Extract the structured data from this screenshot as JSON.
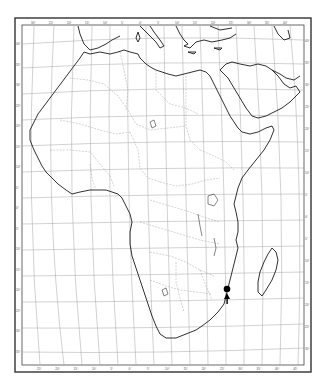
{
  "map": {
    "title_partial": "",
    "region": "Africa",
    "projection": "conic grid with curved parallels",
    "colors": {
      "coastline": "#1a1a1a",
      "borders": "#a8a8a8",
      "graticule": "#9a9a9a",
      "frame": "#333333",
      "markers": "#000000"
    },
    "top_ticks": [
      "30°",
      "25°",
      "20°",
      "15°",
      "10°",
      "5°",
      "0°",
      "5°",
      "10°",
      "15°",
      "20°",
      "25°",
      "30°",
      "35°",
      "40°"
    ],
    "bottom_ticks": [
      "25°",
      "20°",
      "15°",
      "10°",
      "5°",
      "0°",
      "5°",
      "10°",
      "15°",
      "20°",
      "25°",
      "30°",
      "35°",
      "40°",
      "45°"
    ],
    "left_ticks": [
      "40°",
      "35°",
      "30°",
      "25°",
      "20°",
      "15°",
      "10°",
      "5°",
      "0°",
      "5°",
      "10°",
      "15°",
      "20°",
      "25°",
      "30°",
      "35°"
    ],
    "right_ticks": [
      "40°",
      "35°",
      "30°",
      "25°",
      "20°",
      "15°",
      "10°",
      "5°",
      "0°",
      "5°",
      "10°",
      "15°",
      "20°",
      "25°",
      "30°"
    ],
    "markers": [
      {
        "label": "occurrence-1",
        "shape": "circle",
        "x": 227,
        "y": 289,
        "r": 3.2
      },
      {
        "label": "occurrence-2",
        "shape": "triangle",
        "x": 227,
        "y": 296
      },
      {
        "label": "occurrence-3",
        "shape": "small-circle",
        "x": 227,
        "y": 301
      }
    ]
  }
}
